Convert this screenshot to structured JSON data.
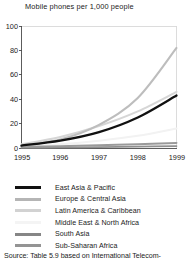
{
  "figure": {
    "title": "Mobile phones per 1,000 people",
    "source": "Source: Table 5.9 based on International Telecom-"
  },
  "chart_data": {
    "type": "line",
    "title": "Mobile phones per 1,000 people",
    "xlabel": "",
    "ylabel": "",
    "x": [
      "1995",
      "1996",
      "1997",
      "1998",
      "1999"
    ],
    "xticklabels": [
      "1995",
      "1996",
      "1997",
      "1998",
      "1999"
    ],
    "yticklabels": [
      "0",
      "20",
      "40",
      "60",
      "80",
      "100"
    ],
    "yticks": [
      0,
      20,
      40,
      60,
      80,
      100
    ],
    "ylim": [
      0,
      100
    ],
    "xlim": [
      "1995",
      "1999"
    ],
    "grid": false,
    "legend_position": "below",
    "series": [
      {
        "name": "East Asia & Pacific",
        "color": "#111111",
        "values": [
          2,
          6,
          13,
          25,
          43
        ]
      },
      {
        "name": "Europe & Central Asia",
        "color": "#bdbdbd",
        "values": [
          2,
          7,
          19,
          41,
          82
        ]
      },
      {
        "name": "Latin America & Caribbean",
        "color": "#d6d6d6",
        "values": [
          3,
          9,
          18,
          30,
          46
        ]
      },
      {
        "name": "Middle East & North Africa",
        "color": "#f2f2f2",
        "values": [
          1,
          3,
          6,
          10,
          16
        ]
      },
      {
        "name": "South Asia",
        "color": "#8f8f8f",
        "values": [
          0.2,
          0.4,
          0.7,
          1.1,
          1.6
        ]
      },
      {
        "name": "Sub-Saharan Africa",
        "color": "#9a9a9a",
        "values": [
          1,
          1.5,
          2.2,
          3.1,
          4.2
        ]
      }
    ]
  },
  "legend": {
    "items": [
      {
        "label": "East Asia & Pacific",
        "color": "#111111"
      },
      {
        "label": "Europe & Central Asia",
        "color": "#b5b5b5"
      },
      {
        "label": "Latin America & Caribbean",
        "color": "#d2d2d2"
      },
      {
        "label": "Middle East & North Africa",
        "color": "#f4f4f4"
      },
      {
        "label": "South Asia",
        "color": "#868686"
      },
      {
        "label": "Sub-Saharan Africa",
        "color": "#949494"
      }
    ]
  }
}
